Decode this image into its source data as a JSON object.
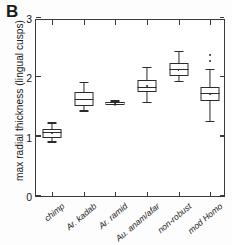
{
  "panel": {
    "label": "B"
  },
  "axes": {
    "ylabel": "max radial thickness (lingual cusps)",
    "xlabel": "",
    "yticks": [
      "0",
      "1",
      "2",
      "3"
    ]
  },
  "chart_data": {
    "type": "box",
    "title": "",
    "subtitle": "",
    "panel_label": "B",
    "xlabel": "",
    "ylabel": "max radial thickness (lingual cusps)",
    "ylim": [
      0,
      3
    ],
    "ytick_values": [
      0,
      1,
      2,
      3
    ],
    "grid": false,
    "legend": "none",
    "categories": [
      "chimp",
      "Ar. kadab",
      "Ar. ramid",
      "Au. anam/afar",
      "non-robust",
      "mod Homo"
    ],
    "boxes": [
      {
        "category": "chimp",
        "whisker_low": 0.9,
        "q1": 0.98,
        "median": 1.06,
        "q3": 1.13,
        "whisker_high": 1.22,
        "mean": 1.07,
        "outliers": []
      },
      {
        "category": "Ar. kadab",
        "whisker_low": 1.42,
        "q1": 1.52,
        "median": 1.62,
        "q3": 1.76,
        "whisker_high": 1.9,
        "mean": 1.63,
        "outliers": []
      },
      {
        "category": "Ar. ramid",
        "whisker_low": 1.53,
        "q1": 1.54,
        "median": 1.56,
        "q3": 1.58,
        "whisker_high": 1.59,
        "mean": 1.56,
        "outliers": []
      },
      {
        "category": "Au. anam/afar",
        "whisker_low": 1.56,
        "q1": 1.76,
        "median": 1.82,
        "q3": 1.95,
        "whisker_high": 2.15,
        "mean": 1.86,
        "outliers": []
      },
      {
        "category": "non-robust",
        "whisker_low": 1.92,
        "q1": 2.02,
        "median": 2.12,
        "q3": 2.24,
        "whisker_high": 2.42,
        "mean": 2.13,
        "outliers": []
      },
      {
        "category": "mod Homo",
        "whisker_low": 1.25,
        "q1": 1.6,
        "median": 1.72,
        "q3": 1.83,
        "whisker_high": 2.12,
        "mean": 1.72,
        "outliers": [
          2.28,
          2.38
        ]
      }
    ]
  }
}
